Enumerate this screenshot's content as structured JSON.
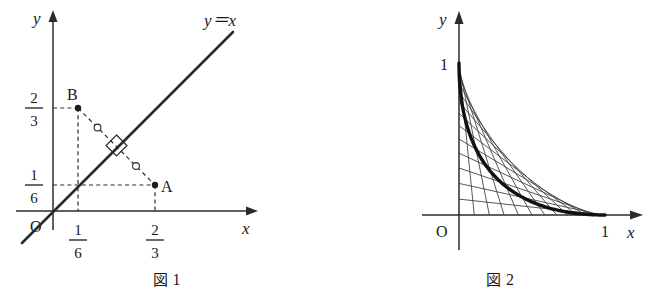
{
  "figure1": {
    "caption_symbol": "図",
    "caption_number": "1",
    "axis_x_label": "x",
    "axis_y_label": "y",
    "origin_label": "O",
    "line_label": "y＝x",
    "points": [
      {
        "name": "A",
        "label": "A",
        "x": 0.6667,
        "y": 0.1667
      },
      {
        "name": "B",
        "label": "B",
        "x": 0.1667,
        "y": 0.6667
      }
    ],
    "y_ticks": [
      {
        "numerator": "2",
        "denominator": "3",
        "value": 0.6667
      },
      {
        "numerator": "1",
        "denominator": "6",
        "value": 0.1667
      }
    ],
    "x_ticks": [
      {
        "numerator": "1",
        "denominator": "6",
        "value": 0.1667
      },
      {
        "numerator": "2",
        "denominator": "3",
        "value": 0.6667
      }
    ],
    "equal_mark_count": 2,
    "right_angle_mark": true
  },
  "figure2": {
    "caption_symbol": "図",
    "caption_number": "2",
    "axis_x_label": "x",
    "axis_y_label": "y",
    "origin_label": "O",
    "x_ticks": [
      {
        "label": "1",
        "value": 1
      }
    ],
    "y_ticks": [
      {
        "label": "1",
        "value": 1
      }
    ],
    "family_line_count": 14,
    "envelope_curve": "astroid"
  },
  "chart_data": [
    {
      "type": "line",
      "title": "図 1",
      "xlabel": "x",
      "ylabel": "y",
      "xlim": [
        -0.25,
        1.05
      ],
      "ylim": [
        -0.22,
        1.0
      ],
      "grid": false,
      "legend": "none",
      "series": [
        {
          "name": "y = x",
          "label": "y＝x",
          "kind": "line",
          "slope": 1,
          "intercept": 0,
          "x": [
            -0.2,
            0.88
          ],
          "y": [
            -0.2,
            0.88
          ]
        },
        {
          "name": "segment AB",
          "kind": "dashed-segment",
          "x": [
            0.6667,
            0.1667
          ],
          "y": [
            0.1667,
            0.6667
          ]
        }
      ],
      "points": [
        {
          "label": "A",
          "x": 0.6667,
          "y": 0.1667
        },
        {
          "label": "B",
          "x": 0.1667,
          "y": 0.6667
        }
      ],
      "xticks": [
        0.1667,
        0.6667
      ],
      "xticklabels": [
        "1/6",
        "2/3"
      ],
      "yticks": [
        0.1667,
        0.6667
      ],
      "yticklabels": [
        "1/6",
        "2/3"
      ],
      "annotations": [
        "right angle where AB meets y = x",
        "two equal-length tick marks on AB"
      ]
    },
    {
      "type": "line",
      "title": "図 2",
      "xlabel": "x",
      "ylabel": "y",
      "xlim": [
        -0.22,
        1.15
      ],
      "ylim": [
        -0.2,
        1.12
      ],
      "grid": false,
      "legend": "none",
      "xticks": [
        1
      ],
      "xticklabels": [
        "1"
      ],
      "yticks": [
        1
      ],
      "yticklabels": [
        "1"
      ],
      "series": [
        {
          "name": "envelope (astroid arc)",
          "kind": "curve",
          "equation": "sqrt(x) + sqrt(y) = 1",
          "x": [
            0,
            0.04,
            0.09,
            0.16,
            0.25,
            0.36,
            0.49,
            0.64,
            0.81,
            1.0
          ],
          "y": [
            1.0,
            0.64,
            0.49,
            0.36,
            0.25,
            0.16,
            0.09,
            0.04,
            0.01,
            0.0
          ]
        },
        {
          "name": "unit segment family",
          "kind": "line-family",
          "description": "segments of length 1 from (cos t, 0) to (0, sin t)",
          "count": 14
        }
      ],
      "annotations": [
        "family of unit-length segments tangent to the astroid arc"
      ]
    }
  ]
}
